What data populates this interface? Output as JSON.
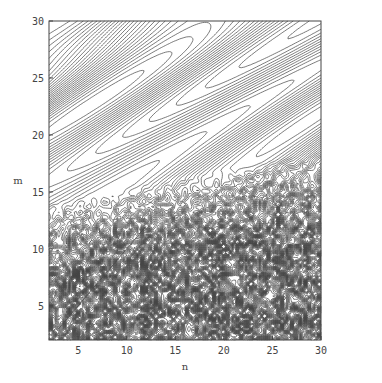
{
  "chart_data": {
    "type": "contour",
    "title": "",
    "xlabel": "n",
    "ylabel": "m",
    "xlim": [
      2,
      30
    ],
    "ylim": [
      2,
      30
    ],
    "x_ticks": [
      5,
      10,
      15,
      20,
      25,
      30
    ],
    "y_ticks": [
      5,
      10,
      15,
      20,
      25,
      30
    ],
    "x_tick_labels": [
      "5",
      "10",
      "15",
      "20",
      "25",
      "30"
    ],
    "y_tick_labels": [
      "5",
      "10",
      "15",
      "20",
      "25",
      "30"
    ],
    "grid": false,
    "legend": null,
    "line_color": "#444444",
    "background": "#ffffff"
  },
  "frame": {
    "left": 49,
    "top": 21,
    "right": 321,
    "bottom": 340
  }
}
